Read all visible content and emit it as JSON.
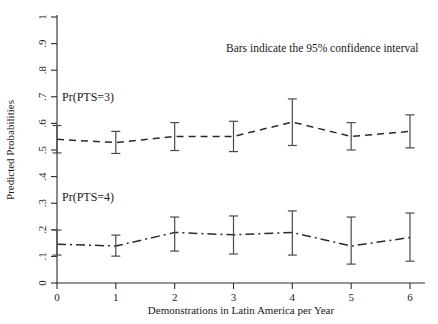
{
  "chart_data": {
    "type": "line",
    "title": "",
    "xlabel": "Demonstrations in Latin America per Year",
    "ylabel": "Predicted Probabilities",
    "annotation": "Bars indicate the 95% confidence interval",
    "x": [
      0,
      1,
      2,
      3,
      4,
      5,
      6
    ],
    "xtick_labels": [
      "0",
      "1",
      "2",
      "3",
      "4",
      "5",
      "6"
    ],
    "ytick_labels": [
      "0",
      ".1",
      ".2",
      ".3",
      ".4",
      ".5",
      ".6",
      ".7",
      ".8",
      ".9",
      "1"
    ],
    "ytick_values": [
      0,
      0.1,
      0.2,
      0.3,
      0.4,
      0.5,
      0.6,
      0.7,
      0.8,
      0.9,
      1
    ],
    "xlim": [
      0,
      6
    ],
    "ylim": [
      0,
      1
    ],
    "grid": false,
    "legend_position": "inline-labels",
    "error_bars": "95% confidence interval",
    "series": [
      {
        "name": "Pr(PTS=3)",
        "label": "Pr(PTS=3)",
        "line_style": "dashed",
        "values": [
          0.54,
          0.528,
          0.551,
          0.551,
          0.605,
          0.551,
          0.57
        ],
        "ci_lower": [
          0.489,
          0.487,
          0.498,
          0.494,
          0.517,
          0.5,
          0.508
        ],
        "ci_upper": [
          0.592,
          0.57,
          0.603,
          0.608,
          0.692,
          0.603,
          0.632
        ]
      },
      {
        "name": "Pr(PTS=4)",
        "label": "Pr(PTS=4)",
        "line_style": "dash-dot",
        "values": [
          0.146,
          0.139,
          0.19,
          0.181,
          0.19,
          0.139,
          0.171
        ],
        "ci_lower": [
          0.105,
          0.101,
          0.12,
          0.109,
          0.105,
          0.071,
          0.082
        ],
        "ci_upper": [
          0.199,
          0.18,
          0.248,
          0.252,
          0.271,
          0.248,
          0.263
        ]
      }
    ]
  },
  "colors": {
    "line": "#2b2b2b",
    "errorbar": "#4a4a4a",
    "axis": "#2b2b2b",
    "background": "#ffffff"
  }
}
